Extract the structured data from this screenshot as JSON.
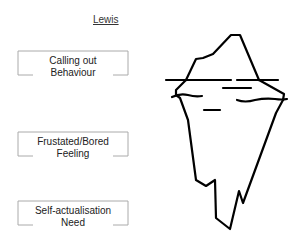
{
  "title": "Lewis",
  "boxes": [
    {
      "line1": "Calling out",
      "line2": "Behaviour"
    },
    {
      "line1": "Frustated/Bored",
      "line2": "Feeling"
    },
    {
      "line1": "Self-actualisation",
      "line2": "Need"
    }
  ],
  "iceberg": {
    "stroke": "#000000",
    "label": "iceberg-illustration"
  },
  "colors": {
    "box_border": "#aaaaaa",
    "text": "#222222"
  }
}
